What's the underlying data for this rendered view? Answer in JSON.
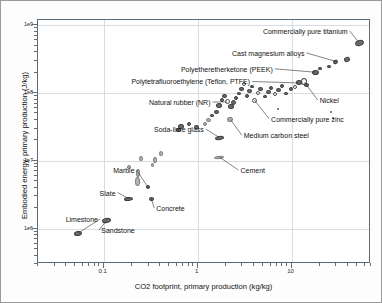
{
  "chart": {
    "type": "scatter",
    "title": "",
    "xlabel": "CO2 footprint, primary production (kg/kg)",
    "ylabel": "Embodied energy, primary production (J/kg)",
    "xscale": "log",
    "yscale": "log",
    "xlim": [
      0.02,
      70
    ],
    "ylim": [
      300000,
      1200000000
    ],
    "grid": true,
    "legend": "none",
    "xticks": [
      {
        "value": 0.1,
        "label": "0.1"
      },
      {
        "value": 1,
        "label": "1"
      },
      {
        "value": 10,
        "label": "10"
      }
    ],
    "yticks": [
      {
        "value": 1000000000,
        "label": "1e9"
      },
      {
        "value": 100000000,
        "label": "1e8"
      },
      {
        "value": 10000000,
        "label": "1e7"
      },
      {
        "value": 1000000,
        "label": "1e6"
      }
    ],
    "annotations": [
      {
        "label": "Commercially pure titanium",
        "align": "right",
        "tx": 0.93,
        "ty": 0.955,
        "px": 0.965,
        "py": 0.905
      },
      {
        "label": "Cast magnesium alloys",
        "align": "right",
        "tx": 0.8,
        "ty": 0.865,
        "px": 0.895,
        "py": 0.83
      },
      {
        "label": "Polyetheretherketone (PEEK)",
        "align": "right",
        "tx": 0.705,
        "ty": 0.8,
        "px": 0.832,
        "py": 0.786
      },
      {
        "label": "Polytetrafluoroethylene (Teflon, PTFE)",
        "align": "right",
        "tx": 0.637,
        "ty": 0.748,
        "px": 0.782,
        "py": 0.742
      },
      {
        "label": "Natural rubber (NR)",
        "align": "right",
        "tx": 0.518,
        "ty": 0.664,
        "px": 0.568,
        "py": 0.664
      },
      {
        "label": "Nickel",
        "align": "left",
        "tx": 0.846,
        "ty": 0.672,
        "px": 0.8,
        "py": 0.745
      },
      {
        "label": "Commercially pure zinc",
        "align": "left",
        "tx": 0.7,
        "ty": 0.595,
        "px": 0.65,
        "py": 0.672
      },
      {
        "label": "Medium carbon steel",
        "align": "left",
        "tx": 0.618,
        "ty": 0.528,
        "px": 0.578,
        "py": 0.592
      },
      {
        "label": "Soda-lime glass",
        "align": "right",
        "tx": 0.498,
        "ty": 0.553,
        "px": 0.545,
        "py": 0.518
      },
      {
        "label": "Cement",
        "align": "left",
        "tx": 0.608,
        "ty": 0.385,
        "px": 0.545,
        "py": 0.438
      },
      {
        "label": "Marble",
        "align": "right",
        "tx": 0.29,
        "ty": 0.385,
        "px": 0.33,
        "py": 0.315
      },
      {
        "label": "Slate",
        "align": "right",
        "tx": 0.233,
        "ty": 0.293,
        "px": 0.272,
        "py": 0.268
      },
      {
        "label": "Concrete",
        "align": "left",
        "tx": 0.355,
        "ty": 0.23,
        "px": 0.34,
        "py": 0.268
      },
      {
        "label": "Limestone",
        "align": "right",
        "tx": 0.18,
        "ty": 0.184,
        "px": 0.12,
        "py": 0.126
      },
      {
        "label": "Sandstone",
        "align": "left",
        "tx": 0.19,
        "ty": 0.14,
        "px": 0.207,
        "py": 0.18
      }
    ],
    "points": [
      {
        "x": 0.965,
        "y": 0.905,
        "w": 9,
        "h": 6,
        "rot": -20,
        "style": "filled"
      },
      {
        "x": 0.927,
        "y": 0.84,
        "w": 6,
        "h": 5,
        "rot": -20,
        "style": "filled"
      },
      {
        "x": 0.893,
        "y": 0.826,
        "w": 5,
        "h": 4,
        "rot": -20,
        "style": "filled"
      },
      {
        "x": 0.874,
        "y": 0.808,
        "w": 4,
        "h": 3,
        "rot": 0,
        "style": "filled"
      },
      {
        "x": 0.848,
        "y": 0.8,
        "w": 4,
        "h": 3,
        "rot": 0,
        "style": "filled"
      },
      {
        "x": 0.833,
        "y": 0.785,
        "w": 7,
        "h": 5,
        "rot": -10,
        "style": "filled"
      },
      {
        "x": 0.8,
        "y": 0.748,
        "w": 6,
        "h": 7,
        "rot": 0,
        "style": "open"
      },
      {
        "x": 0.806,
        "y": 0.735,
        "w": 5,
        "h": 4,
        "rot": 0,
        "style": "filled"
      },
      {
        "x": 0.783,
        "y": 0.742,
        "w": 6,
        "h": 5,
        "rot": 0,
        "style": "filled"
      },
      {
        "x": 0.772,
        "y": 0.727,
        "w": 4,
        "h": 4,
        "rot": 0,
        "style": "open"
      },
      {
        "x": 0.76,
        "y": 0.716,
        "w": 4,
        "h": 4,
        "rot": 0,
        "style": "filled"
      },
      {
        "x": 0.745,
        "y": 0.7,
        "w": 4,
        "h": 3,
        "rot": 0,
        "style": "filled"
      },
      {
        "x": 0.734,
        "y": 0.73,
        "w": 4,
        "h": 4,
        "rot": 0,
        "style": "filled"
      },
      {
        "x": 0.723,
        "y": 0.712,
        "w": 5,
        "h": 4,
        "rot": 0,
        "style": "filled"
      },
      {
        "x": 0.712,
        "y": 0.695,
        "w": 4,
        "h": 4,
        "rot": 0,
        "style": "open"
      },
      {
        "x": 0.7,
        "y": 0.723,
        "w": 4,
        "h": 4,
        "rot": 0,
        "style": "filled"
      },
      {
        "x": 0.692,
        "y": 0.705,
        "w": 5,
        "h": 4,
        "rot": 0,
        "style": "filled"
      },
      {
        "x": 0.681,
        "y": 0.688,
        "w": 4,
        "h": 3,
        "rot": 0,
        "style": "filled"
      },
      {
        "x": 0.669,
        "y": 0.716,
        "w": 5,
        "h": 4,
        "rot": 0,
        "style": "filled"
      },
      {
        "x": 0.66,
        "y": 0.7,
        "w": 4,
        "h": 4,
        "rot": 0,
        "style": "open"
      },
      {
        "x": 0.651,
        "y": 0.672,
        "w": 5,
        "h": 5,
        "rot": 0,
        "style": "open"
      },
      {
        "x": 0.643,
        "y": 0.726,
        "w": 4,
        "h": 3,
        "rot": 0,
        "style": "filled"
      },
      {
        "x": 0.636,
        "y": 0.709,
        "w": 5,
        "h": 4,
        "rot": 0,
        "style": "filled"
      },
      {
        "x": 0.628,
        "y": 0.69,
        "w": 4,
        "h": 4,
        "rot": 0,
        "style": "filled"
      },
      {
        "x": 0.62,
        "y": 0.738,
        "w": 4,
        "h": 4,
        "rot": 0,
        "style": "open"
      },
      {
        "x": 0.612,
        "y": 0.718,
        "w": 5,
        "h": 4,
        "rot": 0,
        "style": "filled"
      },
      {
        "x": 0.604,
        "y": 0.7,
        "w": 4,
        "h": 3,
        "rot": 0,
        "style": "filled"
      },
      {
        "x": 0.596,
        "y": 0.68,
        "w": 4,
        "h": 4,
        "rot": 0,
        "style": "filled"
      },
      {
        "x": 0.588,
        "y": 0.66,
        "w": 5,
        "h": 5,
        "rot": 0,
        "style": "filled"
      },
      {
        "x": 0.58,
        "y": 0.645,
        "w": 6,
        "h": 5,
        "rot": 0,
        "style": "filled"
      },
      {
        "x": 0.578,
        "y": 0.592,
        "w": 6,
        "h": 5,
        "rot": -10,
        "style": "lite"
      },
      {
        "x": 0.568,
        "y": 0.664,
        "w": 5,
        "h": 5,
        "rot": 0,
        "style": "open"
      },
      {
        "x": 0.56,
        "y": 0.69,
        "w": 5,
        "h": 4,
        "rot": 0,
        "style": "filled"
      },
      {
        "x": 0.552,
        "y": 0.672,
        "w": 4,
        "h": 4,
        "rot": 0,
        "style": "filled"
      },
      {
        "x": 0.545,
        "y": 0.648,
        "w": 6,
        "h": 5,
        "rot": 0,
        "style": "filled"
      },
      {
        "x": 0.545,
        "y": 0.518,
        "w": 9,
        "h": 4,
        "rot": -8,
        "style": "filled"
      },
      {
        "x": 0.536,
        "y": 0.625,
        "w": 5,
        "h": 4,
        "rot": 0,
        "style": "filled"
      },
      {
        "x": 0.524,
        "y": 0.608,
        "w": 4,
        "h": 3,
        "rot": 0,
        "style": "filled"
      },
      {
        "x": 0.512,
        "y": 0.592,
        "w": 5,
        "h": 4,
        "rot": 0,
        "style": "lite"
      },
      {
        "x": 0.5,
        "y": 0.572,
        "w": 4,
        "h": 4,
        "rot": 0,
        "style": "lite"
      },
      {
        "x": 0.476,
        "y": 0.56,
        "w": 5,
        "h": 4,
        "rot": 0,
        "style": "filled"
      },
      {
        "x": 0.452,
        "y": 0.575,
        "w": 4,
        "h": 4,
        "rot": 0,
        "style": "filled"
      },
      {
        "x": 0.43,
        "y": 0.562,
        "w": 6,
        "h": 5,
        "rot": -10,
        "style": "filled"
      },
      {
        "x": 0.423,
        "y": 0.548,
        "w": 5,
        "h": 4,
        "rot": 0,
        "style": "filled"
      },
      {
        "x": 0.88,
        "y": 0.625,
        "w": 2,
        "h": 2,
        "rot": 0,
        "style": "filled"
      },
      {
        "x": 0.886,
        "y": 0.598,
        "w": 2,
        "h": 2,
        "rot": 0,
        "style": "filled"
      },
      {
        "x": 0.722,
        "y": 0.636,
        "w": 2,
        "h": 2,
        "rot": 0,
        "style": "filled"
      },
      {
        "x": 0.545,
        "y": 0.438,
        "w": 10,
        "h": 3,
        "rot": -6,
        "style": "lite"
      },
      {
        "x": 0.368,
        "y": 0.452,
        "w": 4,
        "h": 5,
        "rot": 0,
        "style": "lite"
      },
      {
        "x": 0.352,
        "y": 0.428,
        "w": 4,
        "h": 6,
        "rot": 0,
        "style": "lite"
      },
      {
        "x": 0.345,
        "y": 0.405,
        "w": 3,
        "h": 4,
        "rot": 0,
        "style": "lite"
      },
      {
        "x": 0.308,
        "y": 0.432,
        "w": 4,
        "h": 5,
        "rot": 0,
        "style": "lite"
      },
      {
        "x": 0.3,
        "y": 0.372,
        "w": 4,
        "h": 8,
        "rot": 0,
        "style": "lite"
      },
      {
        "x": 0.3,
        "y": 0.34,
        "w": 5,
        "h": 9,
        "rot": 0,
        "style": "lite"
      },
      {
        "x": 0.272,
        "y": 0.398,
        "w": 4,
        "h": 4,
        "rot": 0,
        "style": "lite"
      },
      {
        "x": 0.33,
        "y": 0.315,
        "w": 4,
        "h": 4,
        "rot": 0,
        "style": "filled"
      },
      {
        "x": 0.272,
        "y": 0.268,
        "w": 9,
        "h": 4,
        "rot": -5,
        "style": "filled"
      },
      {
        "x": 0.34,
        "y": 0.268,
        "w": 5,
        "h": 4,
        "rot": 0,
        "style": "filled"
      },
      {
        "x": 0.207,
        "y": 0.18,
        "w": 9,
        "h": 5,
        "rot": -10,
        "style": "filled"
      },
      {
        "x": 0.12,
        "y": 0.126,
        "w": 8,
        "h": 5,
        "rot": -10,
        "style": "filled"
      }
    ]
  }
}
